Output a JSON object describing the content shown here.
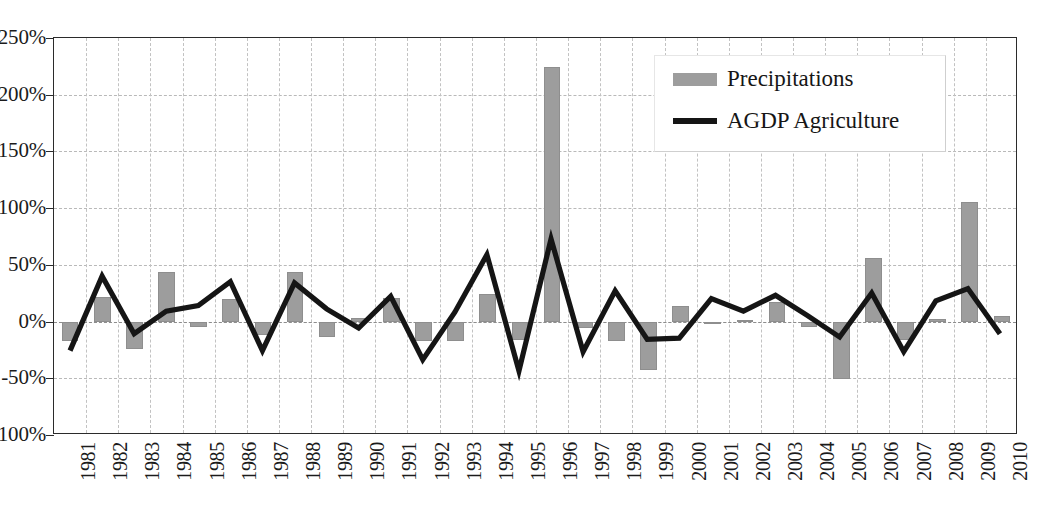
{
  "chart_data": {
    "type": "bar",
    "title": "",
    "xlabel": "",
    "ylabel": "",
    "ylim": [
      -100,
      250
    ],
    "ytick_values": [
      250,
      200,
      150,
      100,
      50,
      0,
      -50,
      -100
    ],
    "ytick_labels": [
      "250%",
      "200%",
      "150%",
      "100%",
      "50%",
      "0%",
      "-50%",
      "-100%"
    ],
    "grid": true,
    "legend_position": "top-right",
    "categories": [
      "1981",
      "1982",
      "1983",
      "1984",
      "1985",
      "1986",
      "1987",
      "1988",
      "1989",
      "1990",
      "1991",
      "1992",
      "1993",
      "1994",
      "1995",
      "1996",
      "1997",
      "1998",
      "1999",
      "2000",
      "2001",
      "2002",
      "2003",
      "2004",
      "2005",
      "2006",
      "2007",
      "2008",
      "2009",
      "2010"
    ],
    "series": [
      {
        "name": "Precipitations",
        "kind": "bar",
        "color": "#9d9d9d",
        "values": [
          -17,
          22,
          -24,
          44,
          -5,
          20,
          -12,
          44,
          -14,
          3,
          21,
          -17,
          -17,
          24,
          -16,
          224,
          -6,
          -17,
          -43,
          14,
          -2,
          1,
          17,
          -5,
          -51,
          56,
          -16,
          2,
          105,
          5
        ]
      },
      {
        "name": "AGDP Agriculture",
        "kind": "line",
        "color": "#151515",
        "values": [
          -27,
          39,
          -12,
          8,
          13,
          34,
          -27,
          33,
          10,
          -7,
          21,
          -35,
          7,
          58,
          -45,
          72,
          -28,
          26,
          -17,
          -16,
          19,
          8,
          22,
          4,
          -15,
          24,
          -28,
          17,
          28,
          -12
        ]
      }
    ]
  },
  "legend": {
    "entries": [
      {
        "label": "Precipitations",
        "marker": "bar-swatch"
      },
      {
        "label": "AGDP Agriculture",
        "marker": "line-swatch"
      }
    ]
  }
}
